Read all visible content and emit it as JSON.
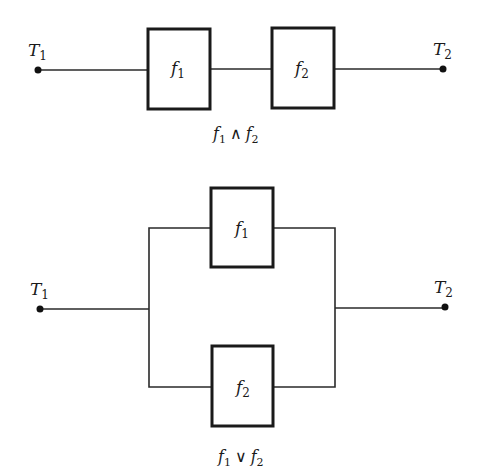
{
  "series_diagram": {
    "terminal_left": {
      "label": "T",
      "sub": "1"
    },
    "terminal_right": {
      "label": "T",
      "sub": "2"
    },
    "box1": {
      "label": "f",
      "sub": "1"
    },
    "box2": {
      "label": "f",
      "sub": "2"
    },
    "caption": {
      "a": "f",
      "a_sub": "1",
      "op": "∧",
      "b": "f",
      "b_sub": "2"
    }
  },
  "parallel_diagram": {
    "terminal_left": {
      "label": "T",
      "sub": "1"
    },
    "terminal_right": {
      "label": "T",
      "sub": "2"
    },
    "box_top": {
      "label": "f",
      "sub": "1"
    },
    "box_bottom": {
      "label": "f",
      "sub": "2"
    },
    "caption": {
      "a": "f",
      "a_sub": "1",
      "op": "∨",
      "b": "f",
      "b_sub": "2"
    }
  },
  "colors": {
    "line": "#1a1a1a",
    "background": "#ffffff"
  }
}
